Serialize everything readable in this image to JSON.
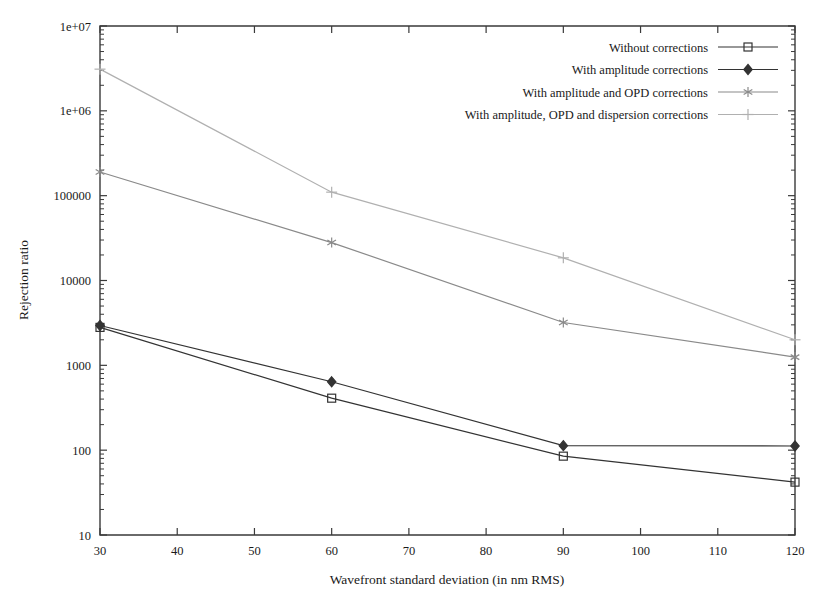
{
  "figure": {
    "background_color": "#ffffff",
    "frame_color": "#3a3a3a"
  },
  "chart_data": {
    "type": "line",
    "title": "",
    "xlabel": "Wavefront standard deviation (in nm RMS)",
    "ylabel": "Rejection ratio",
    "xlim": [
      30,
      120
    ],
    "ylim": [
      10,
      10000000
    ],
    "yscale": "log",
    "xscale": "linear",
    "grid": false,
    "legend_position": "top-right",
    "xticks": [
      30,
      40,
      50,
      60,
      70,
      80,
      90,
      100,
      110,
      120
    ],
    "xticklabels": [
      "30",
      "40",
      "50",
      "60",
      "70",
      "80",
      "90",
      "100",
      "110",
      "120"
    ],
    "yticks": [
      10,
      100,
      1000,
      10000,
      100000,
      1000000,
      10000000
    ],
    "yticklabels": [
      "10",
      "100",
      "1000",
      "10000",
      "100000",
      "1e+06",
      "1e+07"
    ],
    "x": [
      30,
      60,
      90,
      120
    ],
    "series": [
      {
        "name": "Without corrections",
        "marker": "open-square",
        "color": "#333333",
        "values": [
          2800,
          410,
          85,
          42
        ]
      },
      {
        "name": "With amplitude corrections",
        "marker": "filled-diamond",
        "color": "#333333",
        "values": [
          2950,
          640,
          113,
          112
        ]
      },
      {
        "name": "With amplitude and OPD corrections",
        "marker": "asterisk",
        "color": "#8a8a8a",
        "values": [
          190000,
          28000,
          3200,
          1250
        ]
      },
      {
        "name": "With amplitude, OPD and dispersion corrections",
        "marker": "plus",
        "color": "#b0b0b0",
        "values": [
          3100000,
          110000,
          18500,
          2000
        ]
      }
    ]
  },
  "legend": {
    "entries": [
      {
        "label": "Without corrections",
        "marker": "open-square",
        "color": "#333333"
      },
      {
        "label": "With amplitude corrections",
        "marker": "filled-diamond",
        "color": "#333333"
      },
      {
        "label": "With amplitude and OPD corrections",
        "marker": "asterisk",
        "color": "#8a8a8a"
      },
      {
        "label": "With amplitude, OPD and dispersion corrections",
        "marker": "plus",
        "color": "#b0b0b0"
      }
    ]
  }
}
